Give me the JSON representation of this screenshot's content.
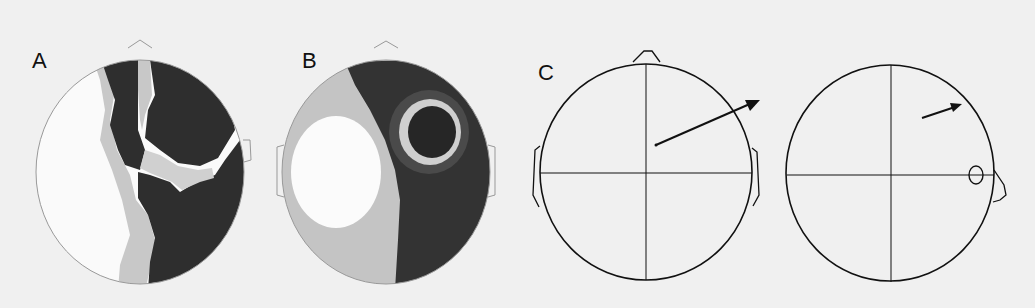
{
  "figure": {
    "background": "#f0f0f0",
    "panels": [
      {
        "id": "A",
        "label": "A",
        "type": "scalp-topographic-map",
        "view": "top (nose up)",
        "levels": [
          "white",
          "light gray",
          "dark gray"
        ],
        "colors": {
          "light": "#fafafa",
          "mid": "#c8c8c8",
          "dark": "#2e2e2e"
        }
      },
      {
        "id": "B",
        "label": "B",
        "type": "scalp-topographic-map",
        "view": "top (nose up)",
        "levels": [
          "white",
          "light gray",
          "dark gray",
          "darker core"
        ],
        "colors": {
          "light": "#fbfbfb",
          "mid": "#c4c4c4",
          "dark": "#333333",
          "ring": "#cfcfcf",
          "core": "#262626"
        }
      },
      {
        "id": "C",
        "label": "C",
        "type": "dipole-head-schematic",
        "subpanels": [
          {
            "view": "top (nose up)",
            "element": "dipole arrow pointing right-up",
            "arrow": {
              "from": [
                656,
                145
              ],
              "to": [
                760,
                100
              ]
            }
          },
          {
            "view": "side (nose right)",
            "element": "dipole arrow pointing right-up with ear ellipse",
            "arrow": {
              "from": [
                922,
                118
              ],
              "to": [
                962,
                104
              ]
            }
          }
        ],
        "stroke_color": "#111111"
      }
    ]
  }
}
